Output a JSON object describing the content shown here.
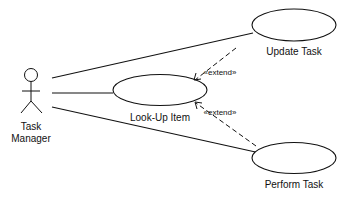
{
  "diagram": {
    "type": "uml-use-case",
    "actor": {
      "label_line1": "Task",
      "label_line2": "Manager"
    },
    "use_cases": [
      {
        "id": "update",
        "label": "Update Task"
      },
      {
        "id": "lookup",
        "label": "Look-Up Item"
      },
      {
        "id": "perform",
        "label": "Perform Task"
      }
    ],
    "associations": [
      {
        "from": "actor",
        "to": "update"
      },
      {
        "from": "actor",
        "to": "lookup"
      },
      {
        "from": "actor",
        "to": "perform"
      }
    ],
    "dependencies": [
      {
        "from": "update",
        "to": "lookup",
        "stereotype": "«extend»"
      },
      {
        "from": "perform",
        "to": "lookup",
        "stereotype": "«extend»"
      }
    ]
  }
}
